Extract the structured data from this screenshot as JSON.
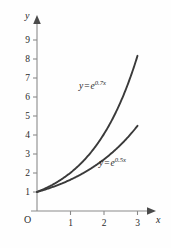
{
  "chart_data": {
    "type": "line",
    "title": "",
    "xlabel": "x",
    "ylabel": "y",
    "origin_label": "O",
    "xlim": [
      0,
      3.35
    ],
    "ylim": [
      0,
      9.6
    ],
    "xticks": [
      "1",
      "2",
      "3"
    ],
    "xtick_values": [
      1,
      2,
      3
    ],
    "yticks": [
      "1",
      "2",
      "3",
      "4",
      "5",
      "6",
      "7",
      "8",
      "9"
    ],
    "ytick_values": [
      1,
      2,
      3,
      4,
      5,
      6,
      7,
      8,
      9
    ],
    "grid": false,
    "legend_position": "inline-annotation",
    "series": [
      {
        "name": "y = e^{0.7x}",
        "label_lhs": "y",
        "label_rel": "=",
        "label_base": "e",
        "label_exponent": "0.7x",
        "rate": 0.7,
        "x": [
          0,
          0.25,
          0.5,
          0.75,
          1,
          1.25,
          1.5,
          1.75,
          2,
          2.25,
          2.5,
          2.75,
          3
        ],
        "values": [
          1,
          1.19,
          1.42,
          1.69,
          2.01,
          2.4,
          2.86,
          3.41,
          4.06,
          4.84,
          5.75,
          6.86,
          8.17
        ]
      },
      {
        "name": "y = e^{0.5x}",
        "label_lhs": "y",
        "label_rel": "=",
        "label_base": "e",
        "label_exponent": "0.5x",
        "rate": 0.5,
        "x": [
          0,
          0.25,
          0.5,
          0.75,
          1,
          1.25,
          1.5,
          1.75,
          2,
          2.25,
          2.5,
          2.75,
          3
        ],
        "values": [
          1,
          1.13,
          1.28,
          1.45,
          1.65,
          1.87,
          2.12,
          2.4,
          2.72,
          3.08,
          3.49,
          3.96,
          4.48
        ]
      }
    ],
    "colors": {
      "curve": "#3a3a3a",
      "axis": "#8a8a8a",
      "background": "#fefefe",
      "text": "#1f1f1f"
    }
  }
}
